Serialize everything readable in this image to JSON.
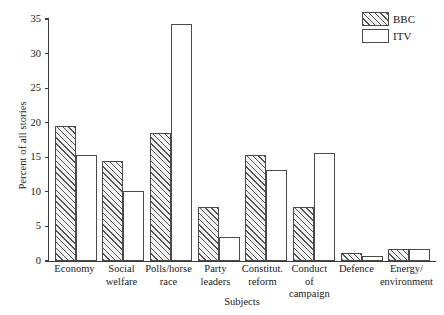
{
  "chart_data": {
    "type": "bar",
    "title": "",
    "xlabel": "Subjects",
    "ylabel": "Percent of all stories",
    "ylim": [
      0,
      35
    ],
    "yticks": [
      0,
      5,
      10,
      15,
      20,
      25,
      30,
      35
    ],
    "grid": false,
    "legend_position": "top-right",
    "categories": [
      "Economy",
      "Social\nwelfare",
      "Polls/horse\nrace",
      "Party\nleaders",
      "Constitut.\nreform",
      "Conduct\nof campaign",
      "Defence",
      "Energy/\nenvironment"
    ],
    "series": [
      {
        "name": "BBC",
        "values": [
          19.5,
          14.5,
          18.5,
          7.8,
          15.4,
          7.8,
          1.2,
          1.8
        ]
      },
      {
        "name": "ITV",
        "values": [
          15.3,
          10.1,
          34.3,
          3.5,
          13.2,
          15.6,
          0.7,
          1.8
        ]
      }
    ]
  },
  "legend": {
    "items": [
      {
        "label": "BBC",
        "pattern": "hatched"
      },
      {
        "label": "ITV",
        "pattern": "solid-white"
      }
    ]
  },
  "colors": {
    "axis": "#3a3a3a",
    "bar_outline": "#4a4a4a",
    "bbc_fill": "#f2f2f2",
    "itv_fill": "#ffffff",
    "background": "#ffffff"
  }
}
